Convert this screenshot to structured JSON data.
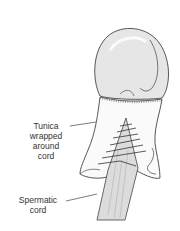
{
  "figure": {
    "labels": {
      "tunica": [
        "Tunica",
        "wrapped",
        "around",
        "cord"
      ],
      "cord": [
        "Spermatic",
        "cord"
      ]
    },
    "colors": {
      "line": "#444444",
      "testis_fill": "#e6e6e6",
      "tunica_fill": "#fafafa",
      "cord_fill": "#dcdcdc",
      "text": "#333333"
    }
  }
}
